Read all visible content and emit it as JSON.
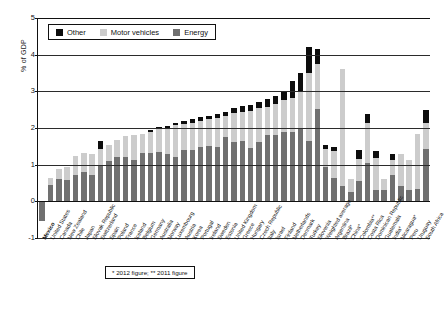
{
  "chart_data": {
    "type": "bar",
    "stacked": true,
    "title": "",
    "xlabel": "",
    "ylabel": "% of GDP",
    "ylim": [
      -1,
      5
    ],
    "yticks": [
      -1,
      0,
      1,
      2,
      3,
      4,
      5
    ],
    "grid": true,
    "legend_position": "top-left",
    "legend": [
      "Other",
      "Motor vehicles",
      "Energy"
    ],
    "colors": {
      "Other": "#0d0d0d",
      "Motor vehicles": "#cccccc",
      "Energy": "#707070",
      "axis": "#111111",
      "background": "#ffffff"
    },
    "footnote": "* 2012 figure; ** 2011 figure",
    "categories": [
      "Mexico",
      "United States",
      "Canada",
      "New Zealand",
      "Chile",
      "Japan",
      "Slovak Republic",
      "Switzerland",
      "Spain",
      "Poland",
      "France",
      "Iceland",
      "Belgium",
      "Germany",
      "Australia",
      "Norway",
      "Luxembourg",
      "Austria",
      "Korea",
      "Portugal",
      "Ireland",
      "Sweden",
      "Estonia",
      "United Kingdom",
      "Greece",
      "Hungary",
      "Czech Republic",
      "Italy",
      "Israel",
      "Finland",
      "Netherlands",
      "Denmark",
      "Turkey",
      "Slovenia",
      "Weighted average",
      "Argentina",
      "Brazil*",
      "China*",
      "Colombia**",
      "Costa Rica",
      "Dominican Republic",
      "Guatemala",
      "India*",
      "Nicaragua*",
      "Peru",
      "Uruguay",
      "South Africa"
    ],
    "series": [
      {
        "name": "Energy",
        "values": [
          -0.55,
          0.45,
          0.6,
          0.58,
          0.73,
          0.8,
          0.72,
          0.98,
          1.1,
          1.22,
          1.22,
          1.12,
          1.32,
          1.32,
          1.35,
          1.3,
          1.2,
          1.4,
          1.4,
          1.48,
          1.52,
          1.48,
          1.75,
          1.62,
          1.65,
          1.45,
          1.62,
          1.82,
          1.8,
          1.88,
          1.88,
          1.98,
          1.65,
          2.52,
          0.95,
          0.65,
          0.42,
          0.25,
          0.55,
          1.05,
          0.3,
          0.3,
          0.72,
          0.42,
          0.3,
          0.35,
          1.42
        ]
      },
      {
        "name": "Motor vehicles",
        "values": [
          0.28,
          0.18,
          0.28,
          0.35,
          0.5,
          0.52,
          0.58,
          0.45,
          0.45,
          0.45,
          0.55,
          0.7,
          0.52,
          0.58,
          0.62,
          0.7,
          0.88,
          0.72,
          0.75,
          0.72,
          0.72,
          0.8,
          0.58,
          0.78,
          0.8,
          1.02,
          0.92,
          0.75,
          0.85,
          0.88,
          0.95,
          1.0,
          1.85,
          1.22,
          0.48,
          0.72,
          3.18,
          0.35,
          0.6,
          1.08,
          0.88,
          0.3,
          0.42,
          0.88,
          0.82,
          1.5,
          0.72
        ]
      },
      {
        "name": "Other",
        "values": [
          0.0,
          0.0,
          0.0,
          0.0,
          0.0,
          0.0,
          0.0,
          0.22,
          0.0,
          0.0,
          0.0,
          0.0,
          0.0,
          0.04,
          0.06,
          0.06,
          0.06,
          0.08,
          0.09,
          0.1,
          0.1,
          0.1,
          0.12,
          0.14,
          0.16,
          0.16,
          0.16,
          0.22,
          0.22,
          0.24,
          0.45,
          0.52,
          0.7,
          0.42,
          0.1,
          0.12,
          0.0,
          0.0,
          0.26,
          0.24,
          0.2,
          0.0,
          0.15,
          0.0,
          0.0,
          0.0,
          0.34
        ]
      }
    ]
  }
}
